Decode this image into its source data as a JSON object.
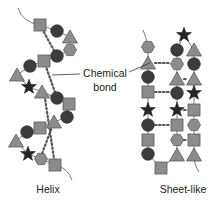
{
  "labels": {
    "callout_line1": "Chemical",
    "callout_line2": "bond",
    "helix": "Helix",
    "sheet": "Sheet-like"
  },
  "colors": {
    "gray_fill": "#8c8c8c",
    "gray_stroke": "#5a5a5a",
    "circle_fill": "#3c3c3c",
    "star_fill": "#262626",
    "chain": "#7a7a7a",
    "dots": "#555555"
  },
  "helix": {
    "units": [
      {
        "shape": "square",
        "x": 40,
        "y": 25
      },
      {
        "shape": "circle",
        "x": 57,
        "y": 31
      },
      {
        "shape": "triangle",
        "x": 70,
        "y": 37
      },
      {
        "shape": "hexagon",
        "x": 70,
        "y": 50
      },
      {
        "shape": "circle",
        "x": 57,
        "y": 56
      },
      {
        "shape": "square",
        "x": 44,
        "y": 61
      },
      {
        "shape": "circle",
        "x": 30,
        "y": 66
      },
      {
        "shape": "triangle",
        "x": 17,
        "y": 75
      },
      {
        "shape": "star",
        "x": 29,
        "y": 87
      },
      {
        "shape": "triangle",
        "x": 42,
        "y": 92
      },
      {
        "shape": "circle",
        "x": 57,
        "y": 98
      },
      {
        "shape": "square",
        "x": 69,
        "y": 104
      },
      {
        "shape": "circle",
        "x": 67,
        "y": 117
      },
      {
        "shape": "triangle",
        "x": 54,
        "y": 122
      },
      {
        "shape": "square",
        "x": 40,
        "y": 128
      },
      {
        "shape": "circle",
        "x": 27,
        "y": 132
      },
      {
        "shape": "triangle",
        "x": 16,
        "y": 141
      },
      {
        "shape": "star",
        "x": 28,
        "y": 154
      },
      {
        "shape": "hexagon",
        "x": 41,
        "y": 159
      },
      {
        "shape": "square",
        "x": 55,
        "y": 165
      }
    ],
    "bonds": [
      [
        40,
        25,
        57,
        56
      ],
      [
        44,
        61,
        57,
        98
      ],
      [
        44,
        92,
        55,
        165
      ],
      [
        54,
        122,
        40,
        159
      ]
    ]
  },
  "sheet": {
    "columns": [
      {
        "x": 148,
        "units": [
          {
            "shape": "hexagon",
            "y": 47
          },
          {
            "shape": "triangle",
            "y": 63
          },
          {
            "shape": "circle",
            "y": 77
          },
          {
            "shape": "square",
            "y": 92
          },
          {
            "shape": "star",
            "y": 110
          },
          {
            "shape": "circle",
            "y": 125
          },
          {
            "shape": "square",
            "y": 140
          },
          {
            "shape": "circle",
            "y": 154
          }
        ]
      },
      {
        "x": 177,
        "units": [
          {
            "shape": "circle",
            "y": 50
          },
          {
            "shape": "hexagon",
            "y": 64
          },
          {
            "shape": "triangle",
            "y": 79
          },
          {
            "shape": "circle",
            "y": 93
          },
          {
            "shape": "star",
            "y": 110
          },
          {
            "shape": "square",
            "y": 125
          },
          {
            "shape": "hexagon",
            "y": 140
          },
          {
            "shape": "triangle",
            "y": 155
          }
        ]
      },
      {
        "x": 194,
        "units": [
          {
            "shape": "triangle",
            "y": 50
          },
          {
            "shape": "circle",
            "y": 64
          },
          {
            "shape": "triangle",
            "y": 79
          },
          {
            "shape": "star",
            "y": 93
          },
          {
            "shape": "square",
            "y": 110
          },
          {
            "shape": "hexagon",
            "y": 125
          },
          {
            "shape": "square",
            "y": 140
          },
          {
            "shape": "triangle",
            "y": 155
          }
        ]
      }
    ],
    "extra_units": [
      {
        "shape": "star",
        "x": 184,
        "y": 35
      },
      {
        "shape": "square",
        "x": 161,
        "y": 168
      }
    ],
    "bonds": [
      [
        155,
        63,
        170,
        63
      ],
      [
        155,
        92,
        170,
        92
      ],
      [
        155,
        125,
        170,
        125
      ],
      [
        184,
        79,
        188,
        79
      ],
      [
        184,
        110,
        188,
        110
      ],
      [
        184,
        140,
        188,
        140
      ]
    ]
  }
}
